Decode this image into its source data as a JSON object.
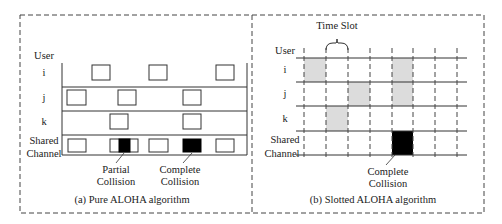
{
  "panels": {
    "pure": {
      "caption": "(a) Pure ALOHA algorithm",
      "axis_label": "User",
      "rows": [
        {
          "label": "i",
          "frames": [
            [
              92,
              110
            ],
            [
              149,
              167
            ],
            [
              216,
              234
            ]
          ]
        },
        {
          "label": "j",
          "frames": [
            [
              67,
              86
            ],
            [
              118,
              136
            ],
            [
              183,
              201
            ]
          ]
        },
        {
          "label": "k",
          "frames": [
            [
              110,
              128
            ],
            [
              183,
              201
            ]
          ]
        }
      ],
      "shared_label_line1": "Shared",
      "shared_label_line2": "Channel",
      "shared_frames": [
        [
          68,
          86
        ],
        [
          110,
          138
        ],
        [
          149,
          168
        ],
        [
          216,
          234
        ]
      ],
      "collision_fills": [
        [
          119,
          130
        ],
        [
          183,
          201
        ]
      ],
      "annotations": [
        {
          "line1": "Partial",
          "line2": "Collision"
        },
        {
          "line1": "Complete",
          "line2": "Collision"
        }
      ]
    },
    "slotted": {
      "caption": "(b) Slotted ALOHA algorithm",
      "axis_label": "User",
      "time_slot_label": "Time Slot",
      "slot_boundaries": [
        304,
        326,
        348,
        370,
        392,
        413,
        435,
        457
      ],
      "rows": [
        {
          "label": "i",
          "shaded_slots": [
            0,
            4
          ]
        },
        {
          "label": "j",
          "shaded_slots": [
            2,
            4
          ]
        },
        {
          "label": "k",
          "shaded_slots": [
            1
          ]
        }
      ],
      "shared_label_line1": "Shared",
      "shared_label_line2": "Channel",
      "collision_slots": [
        4
      ],
      "annotation": {
        "line1": "Complete",
        "line2": "Collision"
      }
    }
  },
  "colors": {
    "line": "#333333",
    "shade": "#dcdcdc",
    "collision": "#000000",
    "dash": "#444444"
  }
}
